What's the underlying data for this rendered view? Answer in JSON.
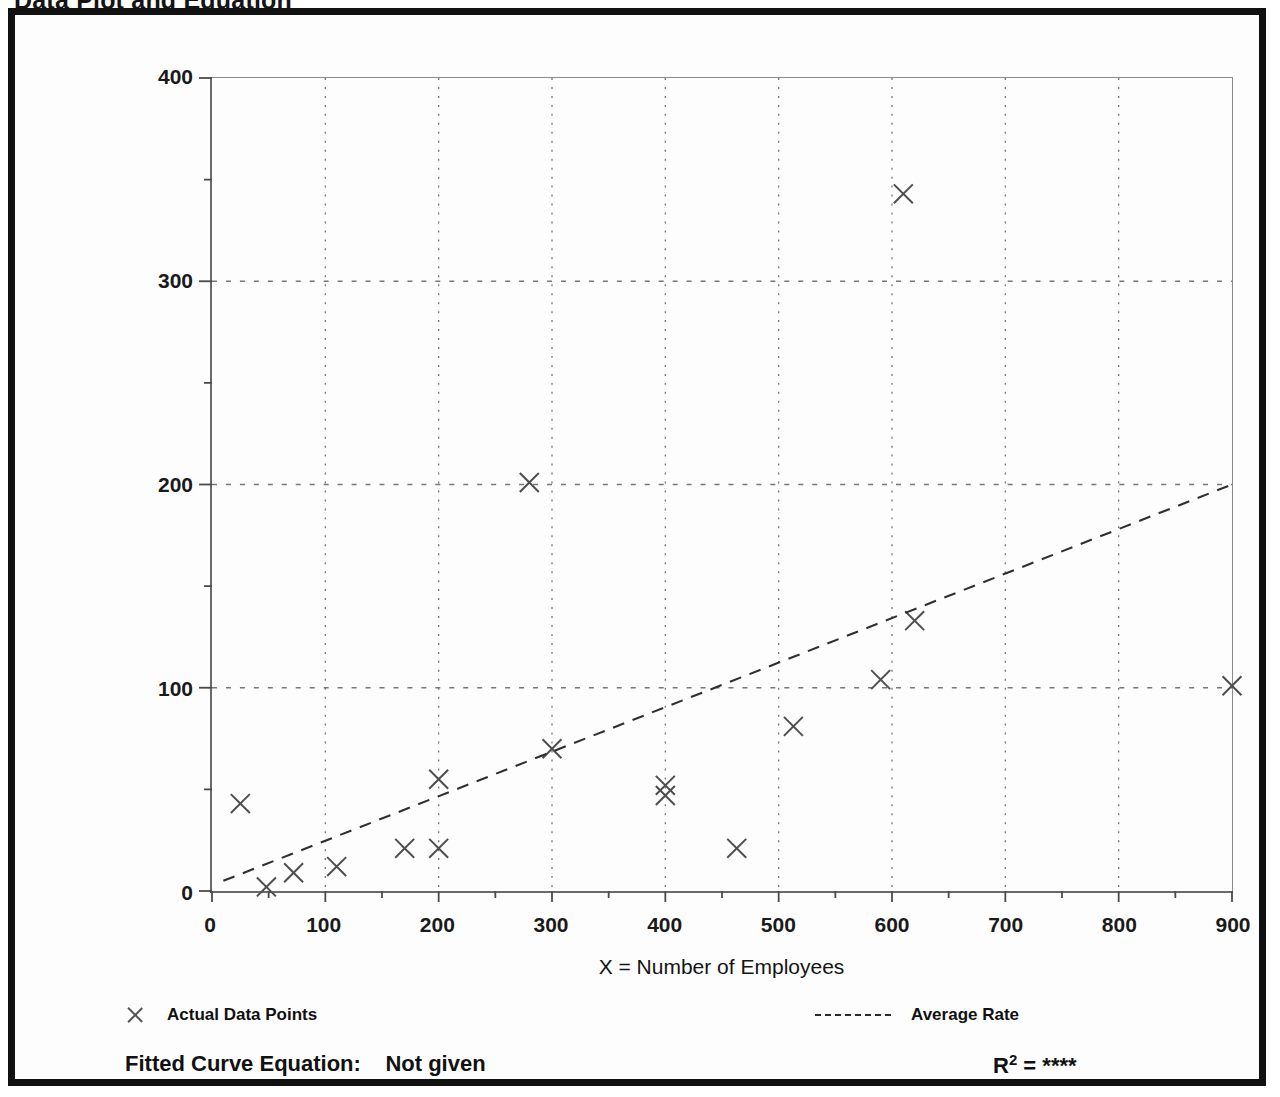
{
  "page": {
    "title": "Data Plot and Equation"
  },
  "legend": {
    "points_marker": "x-marker-icon",
    "points_label": "Actual Data Points",
    "rate_marker": "dashed-line-icon",
    "rate_label": "Average Rate"
  },
  "footer": {
    "equation_label": "Fitted Curve Equation:",
    "equation_value": "Not given",
    "r2_label": "R",
    "r2_exponent": "2",
    "r2_equals": "=",
    "r2_value": "****"
  },
  "chart_data": {
    "type": "scatter",
    "title": "Data Plot and Equation",
    "xlabel": "X = Number of Employees",
    "ylabel": "T = Average Vehicle Trip Ends",
    "xlim": [
      0,
      900
    ],
    "ylim": [
      0,
      400
    ],
    "xticks": [
      0,
      100,
      200,
      300,
      400,
      500,
      600,
      700,
      800,
      900
    ],
    "yticks": [
      0,
      100,
      200,
      300,
      400
    ],
    "x_minor_step": 50,
    "y_minor_step": 50,
    "grid": true,
    "grid_style": "dotted",
    "legend_position": "below-axes",
    "series": [
      {
        "name": "Actual Data Points",
        "type": "scatter",
        "marker": "x",
        "points": [
          {
            "x": 25,
            "y": 43
          },
          {
            "x": 48,
            "y": 2
          },
          {
            "x": 72,
            "y": 9
          },
          {
            "x": 110,
            "y": 12
          },
          {
            "x": 170,
            "y": 21
          },
          {
            "x": 200,
            "y": 21
          },
          {
            "x": 200,
            "y": 55
          },
          {
            "x": 280,
            "y": 201
          },
          {
            "x": 300,
            "y": 70
          },
          {
            "x": 400,
            "y": 47
          },
          {
            "x": 400,
            "y": 52
          },
          {
            "x": 463,
            "y": 21
          },
          {
            "x": 513,
            "y": 81
          },
          {
            "x": 590,
            "y": 104
          },
          {
            "x": 610,
            "y": 343
          },
          {
            "x": 620,
            "y": 133
          },
          {
            "x": 900,
            "y": 101
          }
        ]
      },
      {
        "name": "Average Rate",
        "type": "line",
        "style": "dashed",
        "points": [
          {
            "x": 10,
            "y": 5
          },
          {
            "x": 900,
            "y": 200
          }
        ]
      }
    ]
  }
}
